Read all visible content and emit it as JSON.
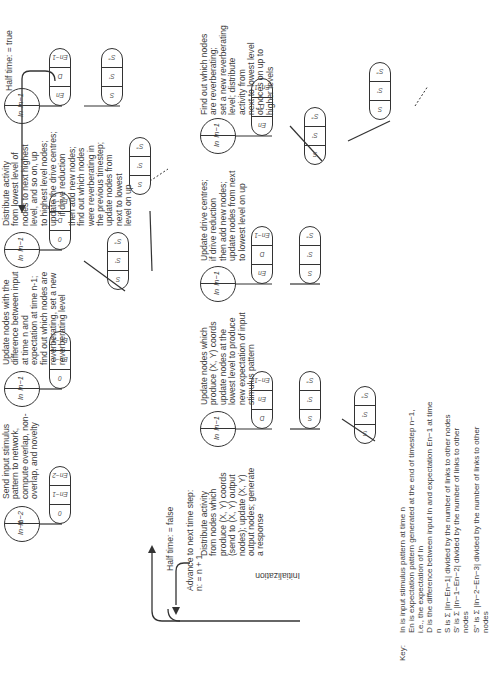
{
  "diagram": {
    "orientation": "rotated 90deg counter-clockwise",
    "flow_labels": {
      "initialization": "Initialization",
      "half_time_false": "Half time: = false",
      "half_time_true": "Half time: = true",
      "advance": "Advance to next time step:\nn: = n + 1"
    },
    "top_row": [
      {
        "id": "send-input",
        "circle": [
          "In−1",
          "In−2"
        ],
        "pill": [
          "0",
          "En−1",
          "En−2"
        ],
        "text": "Send input stimulus\npattern to network,\ncompute overlap, non-\noverlap, and novelty"
      },
      {
        "id": "update-difference",
        "circle": [
          "In",
          "In−1"
        ],
        "pill": [
          "0",
          "En−1",
          "En−2"
        ],
        "text": "Update nodes with the\ndifference between input\nat time n and\nexpectation at time n-1;\nfind out which nodes are\nreverberating, set a new\nreverberating level"
      },
      {
        "id": "distribute-lowest",
        "circle": [
          "In",
          "In−1"
        ],
        "pill": [
          "0",
          "D",
          "En−1"
        ],
        "children": [
          [
            "S",
            "S′",
            "S″"
          ],
          [
            "S",
            "S′",
            "S″"
          ]
        ],
        "text": "Distribute activity\nfrom lowest level of\nnodes to next highest\nlevel, and so on, up\nto highest level nodes;\nupdate the drive centres;\n    if drive reduction\nthen add new nodes;\nfind out which nodes\nwere reverberating in\nthe previous timestep;\nupdate nodes from\nnext to lowest\nlevel on up"
      },
      {
        "id": "half-time-node",
        "circle": [
          "In",
          "In−1"
        ],
        "pill": [
          "En",
          "D",
          "En−1"
        ],
        "children": [
          [
            "S",
            "S′",
            "S″"
          ]
        ]
      }
    ],
    "bottom_row": [
      {
        "id": "distribute-xy",
        "circle": [
          "In",
          "In−1"
        ],
        "pill": [
          "D",
          "En",
          "En−1"
        ],
        "children": [
          [
            "S",
            "S′",
            "S″"
          ],
          [
            "S",
            "S′",
            "S″"
          ]
        ],
        "text": "Distribute activity\nfrom nodes which\nproduce (X, Y) coords\n(send to (X, Y) output\nnodes); update (X, Y)\noutput nodes; generate\na response"
      },
      {
        "id": "update-xy",
        "circle": [
          "In",
          "In−1"
        ],
        "pill": [
          "En",
          "D",
          "En−1"
        ],
        "children": [
          [
            "S",
            "S′",
            "S″"
          ]
        ],
        "text": "Update nodes which\nproduce (X, Y) coords\nupdate nodes at the\nlowest level to produce\nnew expectation of input\nstimulus pattern"
      },
      {
        "id": "update-drive",
        "circle": [
          "In",
          "In−1"
        ],
        "pill": [
          "En",
          "D",
          "En−1"
        ],
        "children": [
          [
            "S",
            "S′",
            "S″"
          ],
          [
            "S",
            "S′",
            "S″"
          ]
        ],
        "text": "Update drive centres;\nif drive reduction\nthen add new nodes;\nupdate nodes from next\nto lowest level on up"
      },
      {
        "id": "find-reverberating",
        "text": "Find out which nodes\nare reverberating;\nset a new reverberating\nlevel; distribute\nactivity from\nnext to lowest level\nof noces on up to\nhigher levels"
      }
    ],
    "key": {
      "title": "Key:",
      "lines": [
        "In is input stimulus pattern at time n",
        "En is expectation pattern generated at the end of timestep n−1,",
        "i.e., the expectation of In",
        "D is the difference between input In and expectation En−1 at time",
        "n",
        "S is Σ |In−En−1| divided by the number of links to other nodes",
        "S′ is Σ |In−1−En−2| divided by the number of links to other",
        "nodes",
        "S″ is Σ |In−2−En−3| divided by the number of links to other",
        "nodes"
      ]
    }
  }
}
